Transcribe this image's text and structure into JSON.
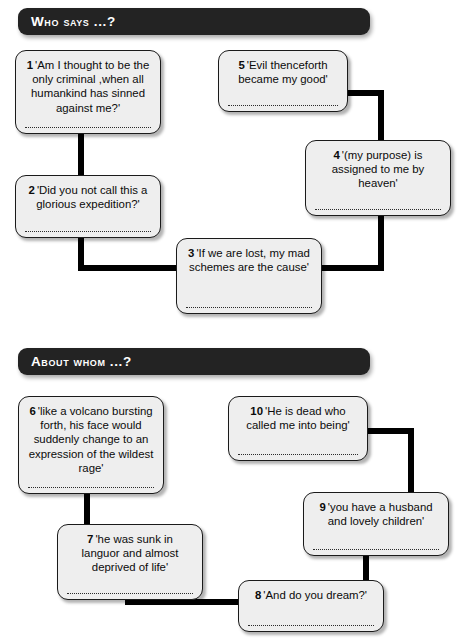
{
  "page": {
    "width": 467,
    "height": 641,
    "background_color": "#ffffff",
    "box_fill_color": "#eeeeee",
    "box_border_color": "#1a1a1a",
    "header_bar_color": "#232323",
    "header_text_color": "#ffffff",
    "connector_color": "#000000"
  },
  "sections": [
    {
      "id": "who-says",
      "header": "Who says ...?"
    },
    {
      "id": "about-whom",
      "header": "About whom ...?"
    }
  ],
  "boxes": [
    {
      "number": "1",
      "quote": "'Am I thought to be the only criminal ,when all humankind has sinned against me?'",
      "section": "who-says"
    },
    {
      "number": "2",
      "quote": "'Did you not call this a glorious expedition?'",
      "section": "who-says"
    },
    {
      "number": "3",
      "quote": "'If we are lost, my mad schemes are the cause'",
      "section": "who-says"
    },
    {
      "number": "4",
      "quote": "'(my purpose) is assigned to me by heaven'",
      "section": "who-says"
    },
    {
      "number": "5",
      "quote": "'Evil thenceforth became my good'",
      "section": "who-says"
    },
    {
      "number": "6",
      "quote": "'like a volcano bursting forth, his face would suddenly change to an expression of the wildest rage'",
      "section": "about-whom"
    },
    {
      "number": "7",
      "quote": "'he was sunk in languor and almost deprived of life'",
      "section": "about-whom"
    },
    {
      "number": "8",
      "quote": "'And do you dream?'",
      "section": "about-whom"
    },
    {
      "number": "9",
      "quote": "'you have a husband and lovely children'",
      "section": "about-whom"
    },
    {
      "number": "10",
      "quote": "'He is dead who called me into being'",
      "section": "about-whom"
    }
  ]
}
